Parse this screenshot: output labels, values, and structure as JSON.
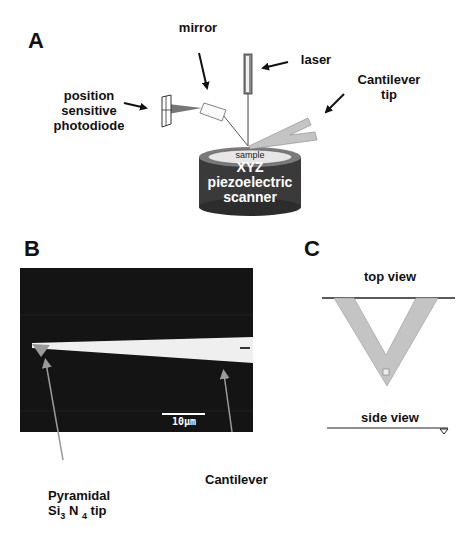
{
  "figure": {
    "panels": [
      {
        "id": "A",
        "label": "A",
        "title": "AFM setup schematic",
        "annotations": {
          "mirror": "mirror",
          "laser": "laser",
          "photodiode": [
            "position",
            "sensitive",
            "photodiode"
          ],
          "cantilever_tip": [
            "Cantilever",
            "tip"
          ],
          "sample": "sample",
          "scanner": [
            "XYZ",
            "piezoelectric",
            "scanner"
          ]
        }
      },
      {
        "id": "B",
        "label": "B",
        "title": "Micrograph of cantilever",
        "scale_bar": "10µm",
        "annotations": {
          "tip": [
            "Pyramidal",
            "Si₃ N₄ tip"
          ],
          "tip_parts": {
            "si": "Si",
            "si_sub": "3",
            "n": " N ",
            "n_sub": "4",
            "rest": " tip"
          },
          "cantilever": "Cantilever"
        }
      },
      {
        "id": "C",
        "label": "C",
        "title": "Cantilever geometry",
        "annotations": {
          "top_view": "top view",
          "side_view": "side view"
        }
      }
    ],
    "colors": {
      "background": "#ffffff",
      "ink": "#111111",
      "scanner_body": "#3a3a3a",
      "cantilever_fill": "#c4c4c4",
      "sem_background": "#141414",
      "sem_cantilever": "#efefef",
      "pointer_gray": "#9a9a9a"
    }
  }
}
